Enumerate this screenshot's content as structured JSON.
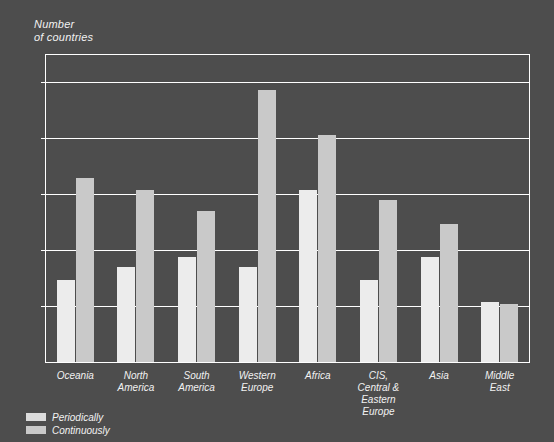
{
  "chart_data": {
    "type": "bar",
    "title": "",
    "ylabel": "Number\nof countries",
    "xlabel": "",
    "ylim": [
      0,
      27.5
    ],
    "yticks": [
      5,
      10,
      15,
      20,
      25
    ],
    "ytick_labels": [
      "5",
      "10",
      "15",
      "20",
      "25"
    ],
    "grid": true,
    "legend_position": "bottom-left",
    "categories": [
      "Oceania",
      "North\nAmerica",
      "South\nAmerica",
      "Western\nEurope",
      "Africa",
      "CIS,\nCentral &\nEastern Europe",
      "Asia",
      "Middle\nEast"
    ],
    "series": [
      {
        "name": "Periodically",
        "color": "#ececec",
        "values": [
          7.3,
          8.5,
          9.4,
          8.5,
          15.4,
          7.3,
          9.4,
          5.4
        ]
      },
      {
        "name": "Continuously",
        "color": "#c9c9c9",
        "values": [
          16.4,
          15.4,
          13.5,
          24.3,
          20.3,
          14.5,
          12.3,
          5.2
        ]
      }
    ]
  },
  "colors": {
    "background": "#4d4d4d",
    "axis": "#ffffff",
    "text": "#f2f2f2",
    "periodically": "#ececec",
    "continuously": "#c9c9c9"
  },
  "legend": {
    "items": [
      {
        "label": "Periodically",
        "key": "periodically"
      },
      {
        "label": "Continuously",
        "key": "continuously"
      }
    ]
  }
}
